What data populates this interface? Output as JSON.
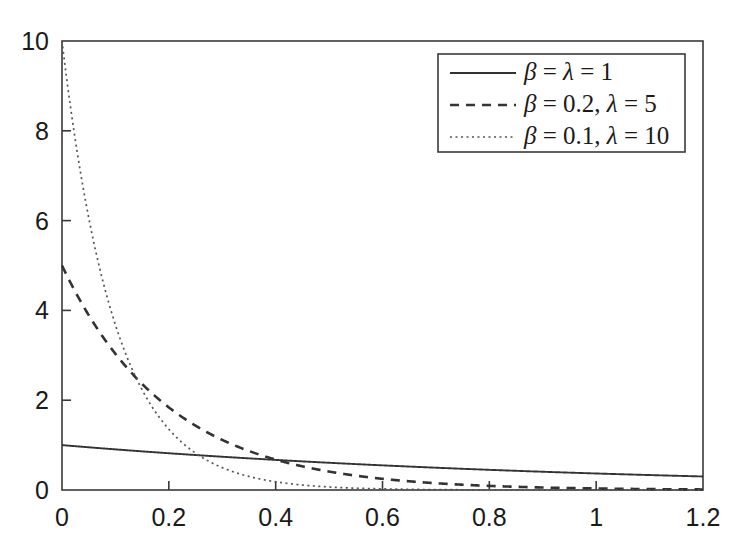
{
  "chart_data": {
    "type": "line",
    "title": "",
    "xlabel": "",
    "ylabel": "",
    "xlim": [
      0,
      1.2
    ],
    "ylim": [
      0,
      10
    ],
    "grid": false,
    "legend_position": "upper right",
    "xticks": [
      "0",
      "0.2",
      "0.4",
      "0.6",
      "0.8",
      "1",
      "1.2"
    ],
    "xtick_values": [
      0,
      0.2,
      0.4,
      0.6,
      0.8,
      1,
      1.2
    ],
    "yticks": [
      "0",
      "2",
      "4",
      "6",
      "8",
      "10"
    ],
    "ytick_values": [
      0,
      2,
      4,
      6,
      8,
      10
    ],
    "series": [
      {
        "name": "beta = lambda = 1",
        "legend_label": "β = λ = 1",
        "linestyle": "solid",
        "color": "#333333",
        "lambda": 1,
        "beta": 1,
        "x": [
          0,
          0.06,
          0.12,
          0.18,
          0.24,
          0.3,
          0.36,
          0.42,
          0.48,
          0.54,
          0.6,
          0.66,
          0.72,
          0.78,
          0.84,
          0.9,
          0.96,
          1.02,
          1.08,
          1.14,
          1.2
        ],
        "values": [
          1.0,
          0.942,
          0.887,
          0.835,
          0.787,
          0.741,
          0.698,
          0.657,
          0.619,
          0.583,
          0.549,
          0.517,
          0.487,
          0.458,
          0.432,
          0.407,
          0.383,
          0.361,
          0.34,
          0.32,
          0.301
        ]
      },
      {
        "name": "beta = 0.2, lambda = 5",
        "legend_label": "β = 0.2, λ = 5",
        "linestyle": "dashed",
        "color": "#333333",
        "lambda": 5,
        "beta": 0.2,
        "x": [
          0,
          0.06,
          0.12,
          0.18,
          0.24,
          0.3,
          0.36,
          0.42,
          0.48,
          0.54,
          0.6,
          0.66,
          0.72,
          0.78,
          0.84,
          0.9,
          0.96,
          1.02,
          1.08,
          1.14,
          1.2
        ],
        "values": [
          5.0,
          3.704,
          2.744,
          2.033,
          1.506,
          1.116,
          0.826,
          0.612,
          0.454,
          0.336,
          0.249,
          0.184,
          0.137,
          0.101,
          0.075,
          0.056,
          0.041,
          0.03,
          0.023,
          0.017,
          0.012
        ]
      },
      {
        "name": "beta = 0.1, lambda = 10",
        "legend_label": "β = 0.1, λ = 10",
        "linestyle": "dotted",
        "color": "#555555",
        "lambda": 10,
        "beta": 0.1,
        "x": [
          0,
          0.06,
          0.12,
          0.18,
          0.24,
          0.3,
          0.36,
          0.42,
          0.48,
          0.54,
          0.6,
          0.66,
          0.72,
          0.78,
          0.84,
          0.9,
          0.96,
          1.02,
          1.08,
          1.14,
          1.2
        ],
        "values": [
          10.0,
          5.488,
          3.012,
          1.653,
          0.907,
          0.498,
          0.273,
          0.15,
          0.082,
          0.045,
          0.025,
          0.014,
          0.007,
          0.004,
          0.002,
          0.001,
          0.001,
          0.0,
          0.0,
          0.0,
          0.0
        ]
      }
    ]
  },
  "axes": {
    "frame_color": "#3a3a3a"
  }
}
